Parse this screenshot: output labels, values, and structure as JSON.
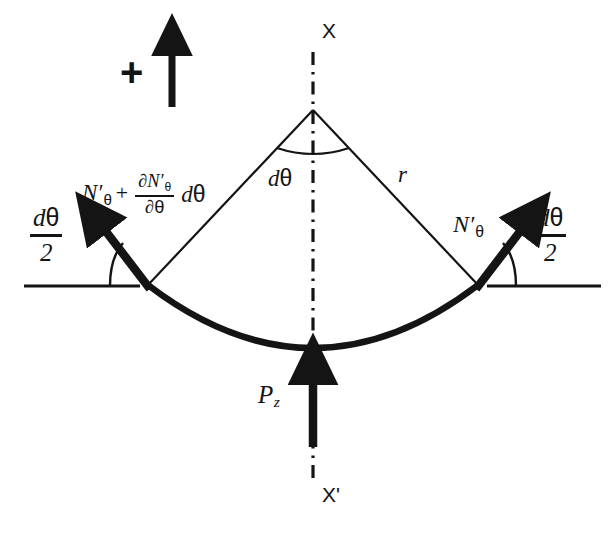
{
  "figure": {
    "background_color": "#ffffff",
    "line_color": "#141414"
  },
  "axis": {
    "top_label": "X",
    "bottom_label": "X'",
    "line_style": "dash-dot",
    "orientation": "vertical"
  },
  "sign_convention": {
    "symbol": "+",
    "arrow_direction": "up"
  },
  "geometry": {
    "apex": {
      "x": 313,
      "y": 110
    },
    "left_corner": {
      "x": 148,
      "y": 285
    },
    "right_corner": {
      "x": 478,
      "y": 285
    },
    "arc_bottom": {
      "x": 313,
      "y": 348
    },
    "radius_label": "r",
    "included_angle_label": "dθ",
    "half_angle_label_left": "dθ/2",
    "half_angle_label_right": "dθ/2"
  },
  "labels": {
    "r": "r",
    "dtheta_apex_d": "d",
    "dtheta_apex_theta": "θ",
    "pz": "P",
    "pz_sub": "z",
    "n_theta": {
      "n": "N",
      "prime": "′",
      "sub": "θ"
    },
    "n_theta_plus": {
      "base_n": "N",
      "base_prime": "′",
      "base_sub": "θ",
      "operator": "+",
      "numerator_partial": "∂",
      "numerator_n": "N",
      "numerator_prime": "′",
      "numerator_sub": "θ",
      "denominator_partial": "∂",
      "denominator_theta": "θ",
      "tail_d": "d",
      "tail_theta": "θ"
    },
    "dtheta_half": {
      "num_d": "d",
      "num_theta": "θ",
      "den": "2"
    }
  },
  "forces": [
    {
      "name": "N'_theta",
      "side": "right",
      "label": "N′θ",
      "direction": "up-right",
      "angle_from_horizontal_deg": 52,
      "angle_annotation": "dθ/2"
    },
    {
      "name": "N'_theta + dN'_theta/dtheta dtheta",
      "side": "left",
      "label": "N′θ + (∂N′θ/∂θ)dθ",
      "direction": "up-left",
      "angle_from_horizontal_deg": 52,
      "angle_annotation": "dθ/2"
    },
    {
      "name": "P_z",
      "side": "bottom",
      "label": "Pz",
      "direction": "up",
      "angle_from_horizontal_deg": 90
    }
  ]
}
